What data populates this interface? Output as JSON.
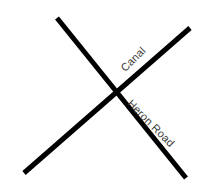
{
  "figure": {
    "type": "road-intersection-diagram",
    "background_color": "#ffffff",
    "width": 200,
    "height": 190
  },
  "styles": {
    "line_color": "#000000",
    "line_width": 5,
    "label_color": "#3c3c3c"
  },
  "labels": {
    "canal": "Canal",
    "heron_road": "Heron Road"
  },
  "chart_data": {
    "type": "diagram",
    "title": "",
    "elements": [
      {
        "name": "Canal",
        "kind": "line",
        "x1": 24,
        "y1": 173,
        "x2": 190,
        "y2": 28,
        "angle_deg": -45,
        "color": "#000000",
        "width": 5
      },
      {
        "name": "Heron Road",
        "kind": "line",
        "x1": 57,
        "y1": 18,
        "x2": 186,
        "y2": 178,
        "angle_deg": 45,
        "color": "#000000",
        "width": 5
      }
    ],
    "intersection": {
      "x": 115,
      "y": 88
    }
  }
}
